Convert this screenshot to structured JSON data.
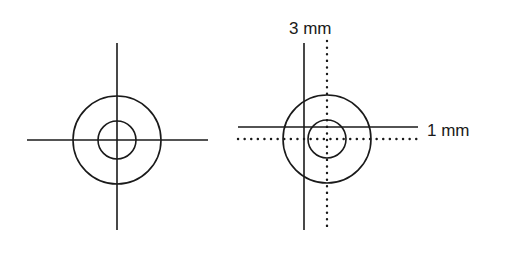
{
  "figure": {
    "left_target": {
      "description": "Reference crosshair centered on concentric circles"
    },
    "right_target": {
      "description": "Offset crosshair (solid) versus centered reference (dotted)",
      "vertical_offset_label": "3 mm",
      "horizontal_offset_label": "1 mm"
    },
    "colors": {
      "line": "#1a1a1a",
      "background": "#ffffff"
    }
  }
}
